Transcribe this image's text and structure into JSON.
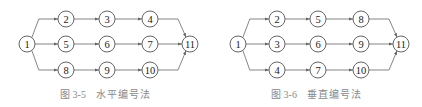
{
  "figures": [
    {
      "id": "fig-3-5",
      "caption_label": "图 3-5",
      "caption_title": "水平编号法",
      "nodes": [
        {
          "label": "1",
          "x": 27,
          "y": 44
        },
        {
          "label": "2",
          "x": 66,
          "y": 19
        },
        {
          "label": "3",
          "x": 107,
          "y": 19
        },
        {
          "label": "4",
          "x": 150,
          "y": 19
        },
        {
          "label": "5",
          "x": 66,
          "y": 44
        },
        {
          "label": "6",
          "x": 107,
          "y": 44
        },
        {
          "label": "7",
          "x": 150,
          "y": 44
        },
        {
          "label": "8",
          "x": 66,
          "y": 70
        },
        {
          "label": "9",
          "x": 107,
          "y": 70
        },
        {
          "label": "10",
          "x": 150,
          "y": 70
        },
        {
          "label": "11",
          "x": 190,
          "y": 44
        }
      ],
      "edges": [
        [
          "1",
          "2"
        ],
        [
          "1",
          "5"
        ],
        [
          "1",
          "8"
        ],
        [
          "2",
          "3"
        ],
        [
          "3",
          "4"
        ],
        [
          "5",
          "6"
        ],
        [
          "6",
          "7"
        ],
        [
          "8",
          "9"
        ],
        [
          "9",
          "10"
        ],
        [
          "4",
          "11"
        ],
        [
          "7",
          "11"
        ],
        [
          "10",
          "11"
        ]
      ]
    },
    {
      "id": "fig-3-6",
      "caption_label": "图 3-6",
      "caption_title": "垂直编号法",
      "nodes": [
        {
          "label": "1",
          "x": 27,
          "y": 44
        },
        {
          "label": "2",
          "x": 66,
          "y": 19
        },
        {
          "label": "5",
          "x": 107,
          "y": 19
        },
        {
          "label": "8",
          "x": 150,
          "y": 19
        },
        {
          "label": "3",
          "x": 66,
          "y": 44
        },
        {
          "label": "6",
          "x": 107,
          "y": 44
        },
        {
          "label": "9",
          "x": 150,
          "y": 44
        },
        {
          "label": "4",
          "x": 66,
          "y": 70
        },
        {
          "label": "7",
          "x": 107,
          "y": 70
        },
        {
          "label": "10",
          "x": 150,
          "y": 70
        },
        {
          "label": "11",
          "x": 190,
          "y": 44
        }
      ],
      "edges": [
        [
          "1",
          "2"
        ],
        [
          "1",
          "3"
        ],
        [
          "1",
          "4"
        ],
        [
          "2",
          "5"
        ],
        [
          "5",
          "8"
        ],
        [
          "3",
          "6"
        ],
        [
          "6",
          "9"
        ],
        [
          "4",
          "7"
        ],
        [
          "7",
          "10"
        ],
        [
          "8",
          "11"
        ],
        [
          "9",
          "11"
        ],
        [
          "10",
          "11"
        ]
      ]
    }
  ],
  "colors": {
    "node_stroke": "#555555",
    "edge": "#666666",
    "caption": "#8a8a8a",
    "text": "#222222"
  }
}
